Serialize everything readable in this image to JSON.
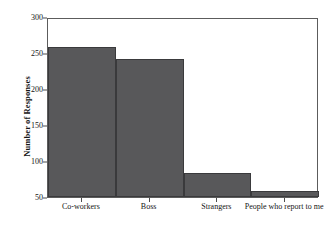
{
  "chart_data": {
    "type": "bar",
    "title": "",
    "xlabel": "",
    "ylabel": "Number of Responses",
    "categories": [
      "Co-workers",
      "Boss",
      "Strangers",
      "People who report to me"
    ],
    "values": [
      259,
      241,
      83,
      59
    ],
    "ylim": [
      50,
      300
    ],
    "yticks": [
      50,
      100,
      150,
      200,
      250,
      300
    ],
    "ytick_labels": [
      "50",
      "100",
      "150",
      "200",
      "250",
      "300"
    ],
    "grid": false,
    "legend": null,
    "bar_color": "#58585a",
    "bar_edge_color": "#3a3a3c",
    "axis_color": "#5c5c5c",
    "background_color": "#ffffff",
    "bars_touching": true,
    "baseline_value": 50
  }
}
